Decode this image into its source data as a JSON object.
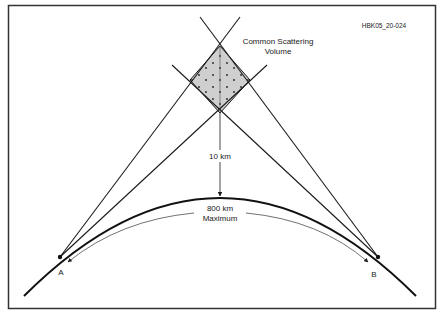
{
  "figure_id": "HBK05_20-024",
  "labels": {
    "scattering_line1": "Common Scattering",
    "scattering_line2": "Volume",
    "height": "10 km",
    "distance_line1": "800 km",
    "distance_line2": "Maximum",
    "point_a": "A",
    "point_b": "B"
  },
  "colors": {
    "line": "#1a1a1a",
    "fill": "#cfcfcf",
    "frame": "#333333",
    "text": "#222222"
  }
}
